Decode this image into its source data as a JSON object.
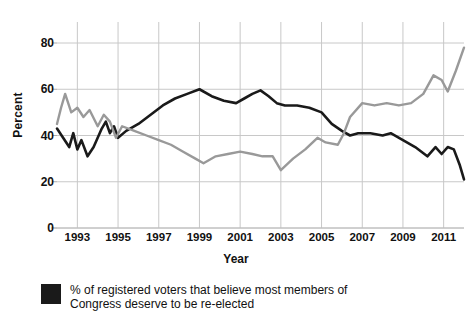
{
  "chart_data": {
    "type": "line",
    "title": "",
    "xlabel": "Year",
    "ylabel": "Percent",
    "xlim": [
      1992.0,
      2012.0
    ],
    "ylim": [
      0,
      88
    ],
    "grid": true,
    "legend_position": "below",
    "yticks": [
      0,
      20,
      40,
      60,
      80
    ],
    "xticks": [
      1993,
      1995,
      1997,
      1999,
      2001,
      2003,
      2005,
      2007,
      2009,
      2011
    ],
    "series": [
      {
        "name": "% of registered voters that believe most members of Congress deserve to be re-elected",
        "color": "#1a1a1a",
        "x": [
          1992.0,
          1992.3,
          1992.6,
          1992.8,
          1993.0,
          1993.2,
          1993.5,
          1993.8,
          1994.0,
          1994.2,
          1994.4,
          1994.6,
          1994.8,
          1995.0,
          1995.4,
          1996.0,
          1996.6,
          1997.2,
          1997.8,
          1998.4,
          1999.0,
          1999.6,
          2000.2,
          2000.8,
          2001.2,
          2001.6,
          2002.0,
          2002.4,
          2002.8,
          2003.2,
          2003.8,
          2004.4,
          2005.0,
          2005.5,
          2006.0,
          2006.4,
          2006.8,
          2007.4,
          2008.0,
          2008.4,
          2009.0,
          2009.6,
          2010.2,
          2010.6,
          2010.9,
          2011.2,
          2011.5,
          2011.8,
          2012.0
        ],
        "y": [
          43,
          39,
          35,
          41,
          34,
          38,
          31,
          35,
          39,
          43,
          46,
          41,
          44,
          39,
          42,
          45,
          49,
          53,
          56,
          58,
          60,
          57,
          55,
          54,
          56,
          58,
          59.5,
          57,
          54,
          53,
          53,
          52,
          50,
          45,
          42,
          40,
          41,
          41,
          40,
          41,
          38,
          35,
          31,
          35,
          32,
          35,
          34,
          27,
          21
        ]
      },
      {
        "name": "gray-series",
        "color": "#999999",
        "x": [
          1992.0,
          1992.2,
          1992.4,
          1992.7,
          1993.0,
          1993.3,
          1993.6,
          1994.0,
          1994.3,
          1994.6,
          1994.9,
          1995.2,
          1995.8,
          1996.4,
          1997.0,
          1997.6,
          1998.2,
          1998.8,
          1999.2,
          1999.8,
          2000.4,
          2001.0,
          2001.6,
          2002.1,
          2002.6,
          2003.0,
          2003.6,
          2004.2,
          2004.8,
          2005.2,
          2005.8,
          2006.1,
          2006.4,
          2007.0,
          2007.6,
          2008.2,
          2008.8,
          2009.4,
          2010.0,
          2010.5,
          2010.9,
          2011.2,
          2011.6,
          2012.0
        ],
        "y": [
          45,
          52,
          58,
          50,
          52,
          48,
          51,
          44,
          49,
          46,
          39,
          44,
          42,
          40,
          38,
          36,
          33,
          30,
          28,
          31,
          32,
          33,
          32,
          31,
          31,
          25,
          30,
          34,
          39,
          37,
          36,
          41,
          48,
          54,
          53,
          54,
          53,
          54,
          58,
          66,
          64,
          59,
          68,
          78
        ]
      }
    ]
  },
  "axis": {
    "ylabel": "Percent",
    "xlabel": "Year",
    "ytick_labels": [
      "80",
      "60",
      "40",
      "20",
      "0"
    ],
    "xtick_labels": [
      "1993",
      "1995",
      "1997",
      "1999",
      "2001",
      "2003",
      "2005",
      "2007",
      "2009",
      "2011"
    ]
  },
  "legend": {
    "swatch_color": "#1a1a1a",
    "label": "% of registered voters that believe most members of Congress deserve to be re-elected"
  },
  "colors": {
    "black_series": "#1a1a1a",
    "gray_series": "#999999",
    "grid": "#c8c8c8",
    "background": "#ffffff"
  }
}
